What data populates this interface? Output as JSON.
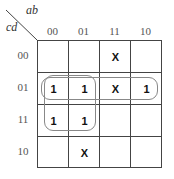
{
  "kmap": {
    "row_var": "cd",
    "col_var": "ab",
    "col_labels": [
      "00",
      "01",
      "11",
      "10"
    ],
    "row_labels": [
      "00",
      "01",
      "11",
      "10"
    ],
    "cells": [
      [
        "",
        "",
        "X",
        ""
      ],
      [
        "1",
        "1",
        "X",
        "1"
      ],
      [
        "1",
        "1",
        "",
        ""
      ],
      [
        "",
        "X",
        "",
        ""
      ]
    ],
    "groups": [
      {
        "name": "row-01-group",
        "cells": "cd=01, all columns"
      },
      {
        "name": "square-group",
        "cells": "cd=01,11 × ab=00,01"
      }
    ]
  }
}
